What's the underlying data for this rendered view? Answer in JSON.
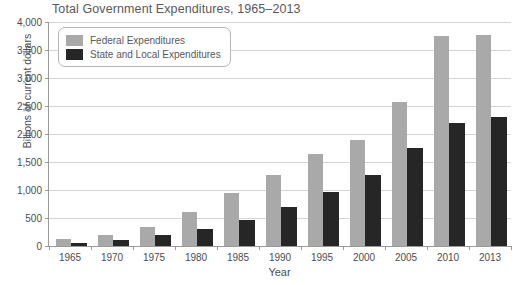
{
  "chart_data": {
    "type": "bar",
    "title": "Total Government Expenditures, 1965–2013",
    "xlabel": "Year",
    "ylabel": "Billions of current dollars",
    "ylim": [
      0,
      4000
    ],
    "ytick_step": 500,
    "ytick_labels": [
      "0",
      "500",
      "1,000",
      "1,500",
      "2,000",
      "2,500",
      "3,000",
      "3,500",
      "4,000"
    ],
    "ytick_values": [
      0,
      500,
      1000,
      1500,
      2000,
      2500,
      3000,
      3500,
      4000
    ],
    "grid": true,
    "legend_position": "top-left",
    "categories": [
      "1965",
      "1970",
      "1975",
      "1980",
      "1985",
      "1990",
      "1995",
      "2000",
      "2005",
      "2010",
      "2013"
    ],
    "series": [
      {
        "name": "Federal Expenditures",
        "color": "#a9a9a9",
        "values": [
          120,
          200,
          340,
          600,
          950,
          1260,
          1650,
          1900,
          2580,
          3750,
          3770
        ]
      },
      {
        "name": "State and Local Expenditures",
        "color": "#262626",
        "values": [
          60,
          110,
          190,
          300,
          470,
          700,
          970,
          1260,
          1750,
          2200,
          2300
        ]
      }
    ]
  },
  "colors": {
    "federal": "#a9a9a9",
    "state_local": "#262626",
    "gridline": "#d4d4d4",
    "axis": "#9a9a9a",
    "text": "#4c4d4f",
    "title_text": "#58595b",
    "background": "#ffffff"
  }
}
